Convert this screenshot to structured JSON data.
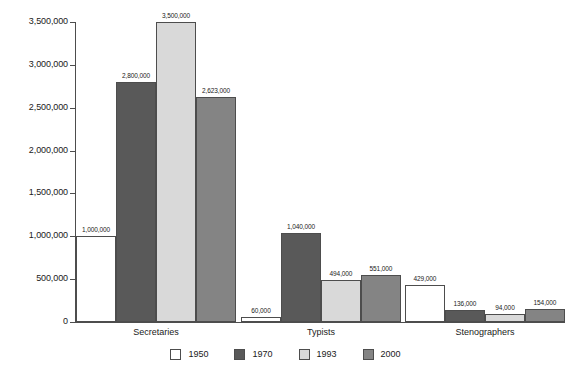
{
  "chart_data": {
    "type": "bar",
    "title": "",
    "subtitle": "",
    "xlabel": "",
    "ylabel": "",
    "categories": [
      "Secretaries",
      "Typists",
      "Stenographers"
    ],
    "series": [
      {
        "name": "1950",
        "color": "#ffffff",
        "values": [
          1000000,
          60000,
          429000
        ],
        "labels": [
          "1,000,000",
          "60,000",
          "429,000"
        ]
      },
      {
        "name": "1970",
        "color": "#595959",
        "values": [
          2800000,
          1040000,
          136000
        ],
        "labels": [
          "2,800,000",
          "1,040,000",
          "136,000"
        ]
      },
      {
        "name": "1993",
        "color": "#d9d9d9",
        "values": [
          3500000,
          494000,
          94000
        ],
        "labels": [
          "3,500,000",
          "494,000",
          "94,000"
        ]
      },
      {
        "name": "2000",
        "color": "#848484",
        "values": [
          2623000,
          551000,
          154000
        ],
        "labels": [
          "2,623,000",
          "551,000",
          "154,000"
        ]
      }
    ],
    "ylim": [
      0,
      3500000
    ],
    "ytick_values": [
      0,
      500000,
      1000000,
      1500000,
      2000000,
      2500000,
      3000000,
      3500000
    ],
    "ytick_labels": [
      "0",
      "500,000",
      "1,000,000",
      "1,500,000",
      "2,000,000",
      "2,500,000",
      "3,000,000",
      "3,500,000"
    ],
    "grid": false,
    "legend_position": "bottom",
    "bar_border_color": "#4d4d4d",
    "axis_color": "#4d4d4d"
  },
  "legend": {
    "entries": [
      {
        "label": "1950"
      },
      {
        "label": "1970"
      },
      {
        "label": "1993"
      },
      {
        "label": "2000"
      }
    ]
  }
}
